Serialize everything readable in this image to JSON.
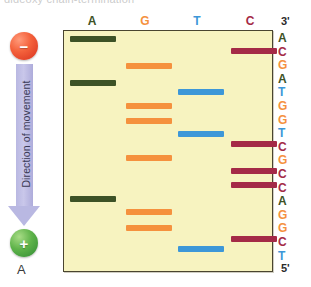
{
  "figure": {
    "clipped_caption": "dideoxy chain-termination",
    "panel_letter": "A"
  },
  "electrophoresis": {
    "negative_electrode": "−",
    "positive_electrode": "+",
    "arrow_label": "Direction of movement",
    "neg_color": "#e8442a",
    "pos_color": "#4fa23f",
    "arrow_color": "#b9b8e2"
  },
  "gel": {
    "background": "#f7f3c0",
    "border_color": "#4a4530",
    "prime_top": "3'",
    "prime_bottom": "5'",
    "lanes": [
      {
        "label": "A",
        "base": "A",
        "color": "#3d5226",
        "center_x": 92,
        "band_left": 70,
        "band_width": 46,
        "band_tops": [
          36,
          80,
          196
        ]
      },
      {
        "label": "G",
        "base": "G",
        "color": "#f5913e",
        "center_x": 145,
        "band_left": 126,
        "band_width": 46,
        "band_tops": [
          63,
          103,
          118,
          155,
          209,
          225
        ]
      },
      {
        "label": "T",
        "base": "T",
        "color": "#3d97d8",
        "center_x": 197,
        "band_left": 178,
        "band_width": 46,
        "band_tops": [
          89,
          131,
          246
        ]
      },
      {
        "label": "C",
        "base": "C",
        "color": "#a42a47",
        "center_x": 250,
        "band_left": 231,
        "band_width": 46,
        "band_tops": [
          48,
          141,
          168,
          182,
          236
        ]
      }
    ]
  },
  "sequence": {
    "direction_top": "3'",
    "direction_bottom": "5'",
    "bases": [
      {
        "letter": "A",
        "color": "#3d5226"
      },
      {
        "letter": "C",
        "color": "#a42a47"
      },
      {
        "letter": "G",
        "color": "#f5913e"
      },
      {
        "letter": "A",
        "color": "#3d5226"
      },
      {
        "letter": "T",
        "color": "#3d97d8"
      },
      {
        "letter": "G",
        "color": "#f5913e"
      },
      {
        "letter": "G",
        "color": "#f5913e"
      },
      {
        "letter": "T",
        "color": "#3d97d8"
      },
      {
        "letter": "C",
        "color": "#a42a47"
      },
      {
        "letter": "G",
        "color": "#f5913e"
      },
      {
        "letter": "C",
        "color": "#a42a47"
      },
      {
        "letter": "C",
        "color": "#a42a47"
      },
      {
        "letter": "A",
        "color": "#3d5226"
      },
      {
        "letter": "G",
        "color": "#f5913e"
      },
      {
        "letter": "G",
        "color": "#f5913e"
      },
      {
        "letter": "C",
        "color": "#a42a47"
      },
      {
        "letter": "T",
        "color": "#3d97d8"
      }
    ]
  }
}
